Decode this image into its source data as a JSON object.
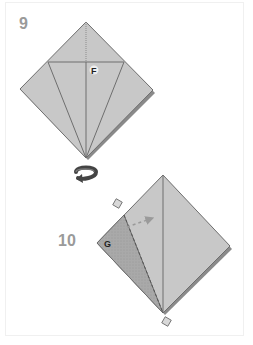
{
  "steps": [
    {
      "number": "9",
      "labels": {
        "point": "F"
      },
      "shape": "kite-fold-diamond"
    },
    {
      "number": "10",
      "labels": {
        "point": "G"
      },
      "shape": "diamond-with-valley-fold"
    }
  ],
  "transition": {
    "icon": "turn-over-icon",
    "meaning": "turn over"
  },
  "colors": {
    "paper": "#c8c8c8",
    "paper_dark": "#a6a6a6",
    "edge": "#6e6e6e",
    "shadow": "#8a8a8a",
    "number": "#9a9a9a",
    "marker": "#d8d8d8",
    "background": "#ffffff"
  }
}
